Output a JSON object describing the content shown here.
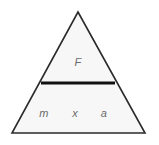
{
  "figure": {
    "name": "formula-triangle",
    "shape": "triangle",
    "background_color": "#ffffff",
    "fill_color": "#f7f7f7",
    "stroke_color": "#2b2b2b",
    "divider_color": "#111111",
    "label_color": "#6b6b6b",
    "geometry": {
      "apex": {
        "x": 78,
        "y": 12
      },
      "bottom_left": {
        "x": 12,
        "y": 133
      },
      "bottom_right": {
        "x": 145,
        "y": 133
      },
      "divider": {
        "x1": 41,
        "x2": 115,
        "y": 83,
        "thickness": 3
      }
    },
    "numerator": {
      "label": "F"
    },
    "denominator": {
      "labels": [
        {
          "text": "m"
        },
        {
          "text": "x"
        },
        {
          "text": "a"
        }
      ]
    }
  }
}
